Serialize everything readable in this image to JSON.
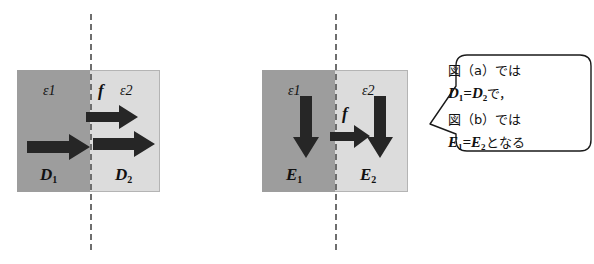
{
  "figure": {
    "background_color": "#ffffff",
    "dark_region_color": "#9d9d9d",
    "light_region_color": "#dcdcdc",
    "arrow_color": "#262626",
    "interface_line_color": "#6e6e6e",
    "text_color": "#111111"
  },
  "panel_a": {
    "name": "panel-a",
    "permittivity_left": "ε1",
    "permittivity_right": "ε2",
    "flux_label": "f",
    "field_left": "D",
    "field_left_sub": "1",
    "field_right": "D",
    "field_right_sub": "2",
    "arrow_left_direction": "right",
    "arrow_flux_direction": "right",
    "arrow_right_direction": "right"
  },
  "panel_b": {
    "name": "panel-b",
    "permittivity_left": "ε1",
    "permittivity_right": "ε2",
    "flux_label": "f",
    "field_left": "E",
    "field_left_sub": "1",
    "field_right": "E",
    "field_right_sub": "2",
    "arrow_left_direction": "down",
    "arrow_flux_direction": "right",
    "arrow_right_direction": "down"
  },
  "callout": {
    "name": "callout-balloon",
    "lines": [
      {
        "text": "図（a）では",
        "style": "kana"
      },
      {
        "text": "D",
        "sub1": "1",
        "eq": "=",
        "text2": "D",
        "sub2": "2",
        "tail": "で，",
        "style": "math"
      },
      {
        "text": "図（b）では",
        "style": "kana"
      },
      {
        "text": "E",
        "sub1": "1",
        "eq": "=",
        "text2": "E",
        "sub2": "2",
        "tail": "となる",
        "style": "math"
      }
    ],
    "line1": "図（a）では",
    "line3": "図（b）では"
  }
}
